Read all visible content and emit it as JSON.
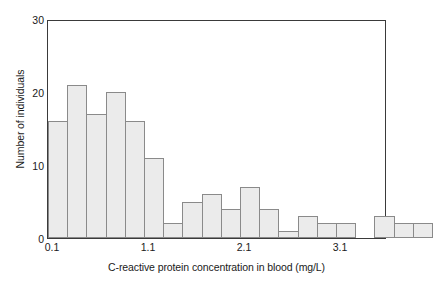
{
  "chart_data": {
    "type": "bar",
    "title": "",
    "xlabel": "C-reactive protein concentration in blood (mg/L)",
    "ylabel": "Number of individuals",
    "xlim": [
      0.1,
      3.5
    ],
    "ylim": [
      0,
      30
    ],
    "bin_width": 0.2,
    "grid": false,
    "legend": null,
    "x_tick_labels": [
      "0.1",
      "1.1",
      "2.1",
      "3.1"
    ],
    "x_tick_values": [
      0.1,
      1.1,
      2.1,
      3.1
    ],
    "y_tick_labels": [
      "0",
      "10",
      "20",
      "30"
    ],
    "y_tick_values": [
      0,
      10,
      20,
      30
    ],
    "bin_starts": [
      0.1,
      0.3,
      0.5,
      0.7,
      0.9,
      1.1,
      1.3,
      1.5,
      1.7,
      1.9,
      2.1,
      2.3,
      2.5,
      2.7,
      2.9,
      3.1,
      3.3,
      3.5,
      3.7,
      3.9
    ],
    "categories": [
      "0.1-0.3",
      "0.3-0.5",
      "0.5-0.7",
      "0.7-0.9",
      "0.9-1.1",
      "1.1-1.3",
      "1.3-1.5",
      "1.5-1.7",
      "1.7-1.9",
      "1.9-2.1",
      "2.1-2.3",
      "2.3-2.5",
      "2.5-2.7",
      "2.7-2.9",
      "2.9-3.1",
      "3.1-3.3",
      "3.3-3.5",
      "3.5-3.7",
      "3.7-3.9",
      "3.9-4.1"
    ],
    "values": [
      16,
      21,
      17,
      20,
      16,
      11,
      2,
      5,
      6,
      4,
      7,
      4,
      1,
      3,
      2,
      2,
      0,
      3,
      2,
      2
    ],
    "bar_fill_color": "#ebebeb",
    "bar_border_color": "#8a8a8a",
    "axis_color": "#3a3a3a",
    "background_color": "#ffffff"
  }
}
